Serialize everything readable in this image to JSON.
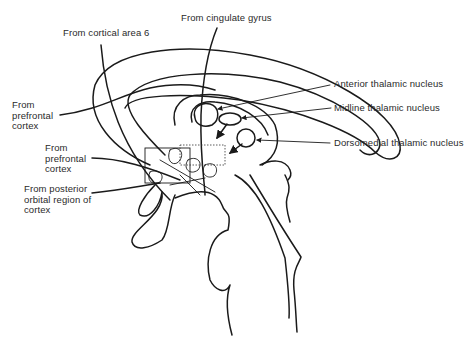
{
  "diagram": {
    "type": "anatomical-sagittal-brain",
    "colors": {
      "line": "#1a1a1a",
      "text": "#2a2a2a",
      "background": "#ffffff"
    },
    "labels": {
      "cingulate": "From cingulate gyrus",
      "cortical_area_6": "From cortical area 6",
      "prefrontal_upper": "From\nprefrontal\ncortex",
      "prefrontal_lower": "From\nprefrontal\ncortex",
      "posterior_orbital": "From posterior\norbital region of\ncortex",
      "anterior_thalamic": "Anterior thalamic nucleus",
      "midline_thalamic": "Midline thalamic nucleus",
      "dorsomedial_thalamic": "Dorsomedial thalamic nucleus"
    }
  }
}
